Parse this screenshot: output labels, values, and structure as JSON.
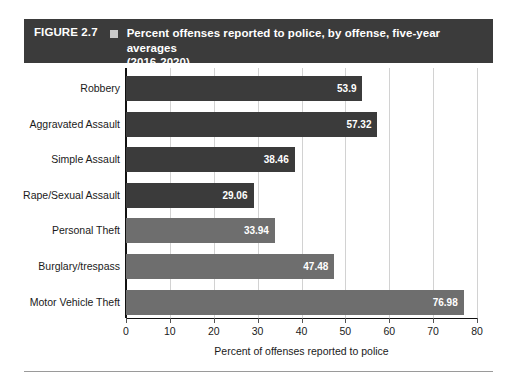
{
  "figure": {
    "number_label": "FIGURE 2.7",
    "marker_icon": "square-bullet-icon",
    "title_line1": "Percent offenses reported to police, by offense, five-year averages",
    "title_line2": "(2016-2020)",
    "header_bg": "#3b3b3b",
    "header_text_color": "#ffffff"
  },
  "chart_data": {
    "type": "bar",
    "orientation": "horizontal",
    "title": "Percent offenses reported to police, by offense, five-year averages (2016-2020)",
    "xlabel": "Percent of offenses reported to police",
    "ylabel": "",
    "xlim": [
      0,
      80
    ],
    "xticks": [
      0,
      10,
      20,
      30,
      40,
      50,
      60,
      70,
      80
    ],
    "xtick_labels": [
      "0",
      "10",
      "20",
      "30",
      "40",
      "50",
      "60",
      "70",
      "80"
    ],
    "grid": true,
    "grid_axis": "x",
    "legend": null,
    "categories": [
      "Robbery",
      "Aggravated Assault",
      "Simple Assault",
      "Rape/Sexual Assault",
      "Personal Theft",
      "Burglary/trespass",
      "Motor Vehicle Theft"
    ],
    "values": [
      53.9,
      57.32,
      38.46,
      29.06,
      33.94,
      47.48,
      76.98
    ],
    "value_labels": [
      "53.9",
      "57.32",
      "38.46",
      "29.06",
      "33.94",
      "47.48",
      "76.98"
    ],
    "bar_colors": [
      "#3b3b3b",
      "#3b3b3b",
      "#3b3b3b",
      "#3b3b3b",
      "#6e6e6e",
      "#6e6e6e",
      "#6e6e6e"
    ]
  }
}
